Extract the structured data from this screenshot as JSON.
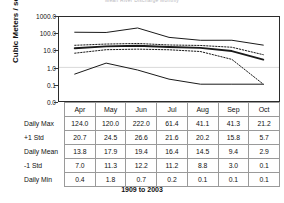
{
  "title": "Mean River Discharge Monthly",
  "footer": "1909 to 2003",
  "axis": {
    "y_label": "Cubic Meters / second",
    "y_ticks": [
      "1000.0",
      "100.0",
      "10.0",
      "1.0",
      "0.1",
      "0.0"
    ]
  },
  "table": {
    "months": [
      "Apr",
      "May",
      "Jun",
      "Jul",
      "Aug",
      "Sep",
      "Oct"
    ],
    "rows": [
      {
        "label": "Daily Max",
        "values": [
          "124.0",
          "120.0",
          "222.0",
          "61.4",
          "41.1",
          "41.3",
          "21.2"
        ]
      },
      {
        "label": "+1 Std",
        "values": [
          "20.7",
          "24.5",
          "26.6",
          "21.6",
          "20.2",
          "15.8",
          "5.7"
        ]
      },
      {
        "label": "Daily Mean",
        "values": [
          "13.8",
          "17.9",
          "19.4",
          "16.4",
          "14.5",
          "9.4",
          "2.9"
        ]
      },
      {
        "label": "-1 Std",
        "values": [
          "7.0",
          "11.3",
          "12.2",
          "11.2",
          "8.8",
          "3.0",
          "0.1"
        ]
      },
      {
        "label": "Daily Min",
        "values": [
          "0.4",
          "1.8",
          "0.7",
          "0.2",
          "0.1",
          "0.1",
          "0.1"
        ]
      }
    ]
  },
  "chart_data": {
    "type": "line",
    "title": "Mean River Discharge Monthly",
    "xlabel": "1909 to 2003",
    "ylabel": "Cubic Meters / second",
    "yscale": "log",
    "ylim": [
      0.03,
      1000.0
    ],
    "ytick_values": [
      1000.0,
      100.0,
      10.0,
      1.0,
      0.1,
      0.0
    ],
    "ytick_labels": [
      "1000.0",
      "100.0",
      "10.0",
      "1.0",
      "0.1",
      "0.0"
    ],
    "grid": "horizontal-at-1.0",
    "legend": "none",
    "categories": [
      "Apr",
      "May",
      "Jun",
      "Jul",
      "Aug",
      "Sep",
      "Oct"
    ],
    "series": [
      {
        "name": "Daily Max",
        "style": "solid",
        "width": "thin",
        "values": [
          124.0,
          120.0,
          222.0,
          61.4,
          41.1,
          41.3,
          21.2
        ]
      },
      {
        "name": "+1 Std",
        "style": "dotted",
        "width": "thin",
        "values": [
          20.7,
          24.5,
          26.6,
          21.6,
          20.2,
          15.8,
          5.7
        ]
      },
      {
        "name": "Daily Mean",
        "style": "solid",
        "width": "thick",
        "values": [
          13.8,
          17.9,
          19.4,
          16.4,
          14.5,
          9.4,
          2.9
        ]
      },
      {
        "name": "-1 Std",
        "style": "dotted",
        "width": "thin",
        "values": [
          7.0,
          11.3,
          12.2,
          11.2,
          8.8,
          3.0,
          0.1
        ]
      },
      {
        "name": "Daily Min",
        "style": "solid",
        "width": "thin",
        "values": [
          0.4,
          1.8,
          0.7,
          0.2,
          0.1,
          0.1,
          0.1
        ]
      }
    ]
  },
  "colors": {
    "line": "#1a1a1a",
    "axis": "#2b2b2b",
    "grid": "#c8c8c8",
    "table_border": "#9a9a9a"
  }
}
